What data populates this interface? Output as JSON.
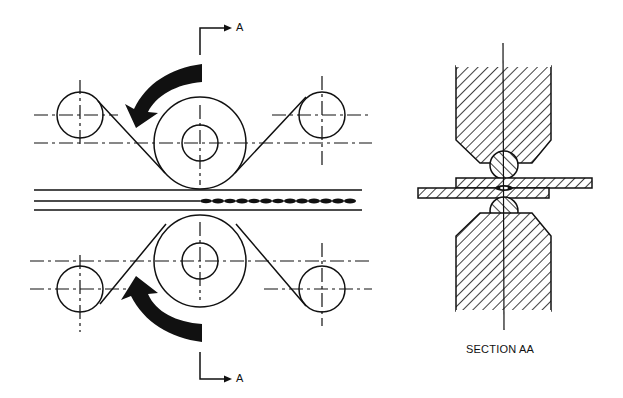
{
  "diagram": {
    "colors": {
      "ink": "#111111",
      "background": "#ffffff"
    },
    "labels": {
      "section_marker_top": "A",
      "section_marker_bottom": "A",
      "section_caption": "SECTION AA"
    },
    "components": {
      "upper_electrode_wheel": {
        "cx": 200,
        "cy": 143,
        "r": 46,
        "hub_r": 18
      },
      "lower_electrode_wheel": {
        "cx": 200,
        "cy": 261,
        "r": 46,
        "hub_r": 18
      },
      "upper_idler_rolls": [
        {
          "cx": 80,
          "cy": 115,
          "r": 23
        },
        {
          "cx": 322,
          "cy": 115,
          "r": 23
        }
      ],
      "lower_idler_rolls": [
        {
          "cx": 80,
          "cy": 289,
          "r": 23
        },
        {
          "cx": 322,
          "cy": 289,
          "r": 23
        }
      ],
      "rotation_arrows": [
        "counter-clockwise (upper)",
        "clockwise (lower)"
      ],
      "workpiece_strips": 2,
      "weld_seam": "continuous nugget line from x=200 to x=358"
    },
    "section_view": {
      "upper_electrode": "hatched, chamfered tip with wire disk",
      "lower_electrode": "hatched, chamfered tip with wire disk",
      "plates": [
        "upper plate (offset right)",
        "lower plate (offset left)"
      ],
      "nugget": "lens-shaped weld at plate interface"
    }
  }
}
